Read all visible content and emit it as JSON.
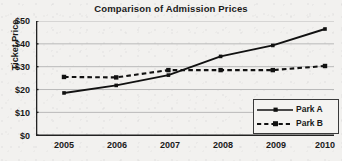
{
  "chart_data": {
    "type": "line",
    "title": "Comparison of Admission Prices",
    "xlabel": "",
    "ylabel": "Ticket Price",
    "x": [
      2005,
      2006,
      2007,
      2008,
      2009,
      2010
    ],
    "categories": [
      "2005",
      "2006",
      "2007",
      "2008",
      "2009",
      "2010"
    ],
    "series": [
      {
        "name": "Park A",
        "values": [
          18.5,
          21.8,
          26.3,
          34.5,
          39.3,
          46.5
        ],
        "linestyle": "solid",
        "marker": "square",
        "color": "#111111"
      },
      {
        "name": "Park B",
        "values": [
          25.5,
          25.3,
          28.5,
          28.5,
          28.5,
          30.3
        ],
        "linestyle": "dashed",
        "marker": "square",
        "color": "#111111"
      }
    ],
    "ylim": [
      0,
      50
    ],
    "yticks": [
      0,
      10,
      20,
      30,
      40,
      50
    ],
    "ytick_labels": [
      "$0",
      "$10",
      "$20",
      "$30",
      "$40",
      "$50"
    ],
    "xtick_labels": [
      "2005",
      "2006",
      "2007",
      "2008",
      "2009",
      "2010"
    ],
    "grid": "horizontal",
    "legend_position": "bottom-right",
    "legend_entries": [
      "Park A",
      "Park B"
    ],
    "colors": {
      "background": "#f2f1ef",
      "axis": "#222222",
      "gridline": "#b9b9b9",
      "text": "#1a1a1a"
    }
  }
}
